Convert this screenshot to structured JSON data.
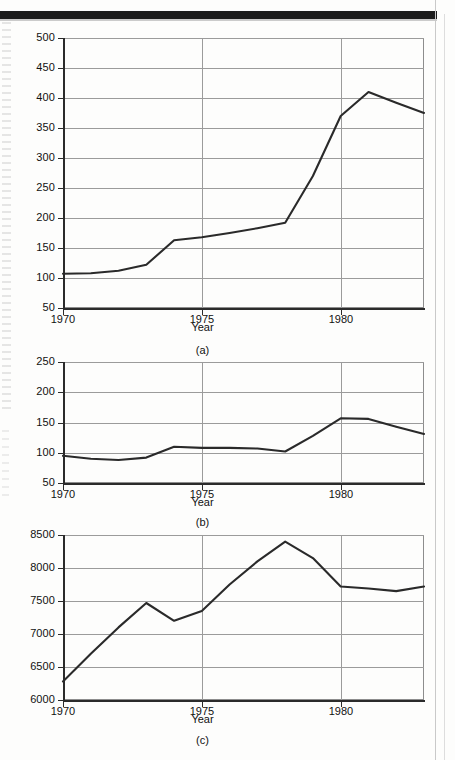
{
  "page": {
    "background_color": "#fdfdfc",
    "rule_color": "#1c1c1c",
    "grid_color": "#9b9b9b",
    "line_color": "#2a2a2a"
  },
  "figure": {
    "panels": [
      {
        "id": "a",
        "caption": "(a)",
        "ylabel": "Nominal Price (1967 = 100)",
        "xlabel": "Year",
        "yticks": [
          "50",
          "100",
          "150",
          "200",
          "250",
          "300",
          "350",
          "400",
          "450",
          "500"
        ],
        "xticks": [
          "1970",
          "1975",
          "1980"
        ]
      },
      {
        "id": "b",
        "caption": "(b)",
        "ylabel": "Relative Price (1967 = 100)",
        "xlabel": "Year",
        "yticks": [
          "50",
          "100",
          "150",
          "200",
          "250"
        ],
        "xticks": [
          "1970",
          "1975",
          "1980"
        ]
      },
      {
        "id": "c",
        "caption": "(c)",
        "ylabel": "Thousands of Barrels per Day",
        "xlabel": "Year",
        "yticks": [
          "6000",
          "6500",
          "7000",
          "7500",
          "8000",
          "8500"
        ],
        "xticks": [
          "1970",
          "1975",
          "1980"
        ]
      }
    ]
  },
  "chart_data": [
    {
      "type": "line",
      "title": "",
      "panel": "(a)",
      "xlabel": "Year",
      "ylabel": "Nominal Price (1967 = 100)",
      "xlim": [
        1970,
        1983
      ],
      "ylim": [
        50,
        500
      ],
      "ytick_values": [
        50,
        100,
        150,
        200,
        250,
        300,
        350,
        400,
        450,
        500
      ],
      "xtick_values": [
        1970,
        1975,
        1980
      ],
      "grid": "horizontal-and-vertical",
      "legend": "none",
      "x": [
        1970,
        1971,
        1972,
        1973,
        1974,
        1975,
        1976,
        1977,
        1978,
        1979,
        1980,
        1981,
        1982,
        1983
      ],
      "values": [
        107,
        108,
        112,
        122,
        163,
        168,
        175,
        183,
        192,
        270,
        370,
        410,
        392,
        375
      ]
    },
    {
      "type": "line",
      "title": "",
      "panel": "(b)",
      "xlabel": "Year",
      "ylabel": "Relative Price (1967 = 100)",
      "xlim": [
        1970,
        1983
      ],
      "ylim": [
        50,
        250
      ],
      "ytick_values": [
        50,
        100,
        150,
        200,
        250
      ],
      "xtick_values": [
        1970,
        1975,
        1980
      ],
      "grid": "horizontal-and-vertical",
      "legend": "none",
      "x": [
        1970,
        1971,
        1972,
        1973,
        1974,
        1975,
        1976,
        1977,
        1978,
        1979,
        1980,
        1981,
        1982,
        1983
      ],
      "values": [
        95,
        90,
        88,
        92,
        110,
        108,
        108,
        107,
        102,
        128,
        157,
        156,
        143,
        131
      ]
    },
    {
      "type": "line",
      "title": "",
      "panel": "(c)",
      "xlabel": "Year",
      "ylabel": "Thousands of Barrels per Day",
      "xlim": [
        1970,
        1983
      ],
      "ylim": [
        6000,
        8500
      ],
      "ytick_values": [
        6000,
        6500,
        7000,
        7500,
        8000,
        8500
      ],
      "xtick_values": [
        1970,
        1975,
        1980
      ],
      "grid": "horizontal-and-vertical",
      "legend": "none",
      "x": [
        1970,
        1971,
        1972,
        1973,
        1974,
        1975,
        1976,
        1977,
        1978,
        1979,
        1980,
        1981,
        1982,
        1983
      ],
      "values": [
        6280,
        6700,
        7100,
        7470,
        7200,
        7350,
        7750,
        8100,
        8400,
        8150,
        7720,
        7690,
        7650,
        7720
      ]
    }
  ]
}
